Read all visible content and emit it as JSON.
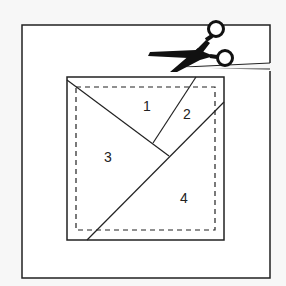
{
  "diagram": {
    "type": "paper-piecing-foundation",
    "background_color": "#f7f7f7",
    "line_color": "#222222",
    "paper_color": "#ffffff",
    "section_labels": [
      {
        "label": "1",
        "x": 147,
        "y": 111
      },
      {
        "label": "2",
        "x": 187,
        "y": 119
      },
      {
        "label": "3",
        "x": 108,
        "y": 162
      },
      {
        "label": "4",
        "x": 184,
        "y": 203
      }
    ],
    "icons": [
      "scissors-icon"
    ]
  }
}
